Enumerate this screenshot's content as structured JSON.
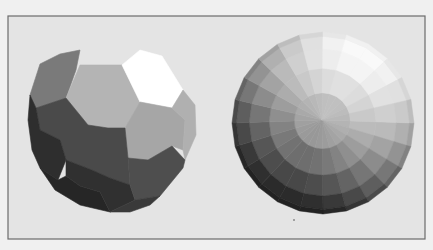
{
  "figure": {
    "background_color": "#f0f0f0",
    "frame_fill": "#e4e4e4",
    "frame_stroke": "#6c6c6c"
  },
  "left_sphere": {
    "label": "truncated-icosahedron sphere (flat shaded)",
    "faces": [
      {
        "name": "face-top-left-hex",
        "shade": "#7a7a7a"
      },
      {
        "name": "face-top-center-hex",
        "shade": "#b4b4b4"
      },
      {
        "name": "face-top-right-pent",
        "shade": "#ffffff"
      },
      {
        "name": "face-right-hex",
        "shade": "#a6a6a6"
      },
      {
        "name": "face-far-right-sliver",
        "shade": "#b0b0b0"
      },
      {
        "name": "face-center-dark-pent",
        "shade": "#4a4a4a"
      },
      {
        "name": "face-left-edge",
        "shade": "#2e2e2e"
      },
      {
        "name": "face-bottom-left",
        "shade": "#262626"
      },
      {
        "name": "face-bottom-center",
        "shade": "#303030"
      },
      {
        "name": "face-lower-right-hex",
        "shade": "#4e4e4e"
      },
      {
        "name": "face-bottom-right",
        "shade": "#3a3a3a"
      }
    ]
  },
  "right_sphere": {
    "label": "faceted UV sphere viewed near pole (flat shaded)",
    "rings": 5,
    "sectors": 24,
    "light_direction_deg": -60,
    "min_shade": 34,
    "max_shade": 255
  },
  "speck": {
    "color": "#8a8a8a"
  }
}
